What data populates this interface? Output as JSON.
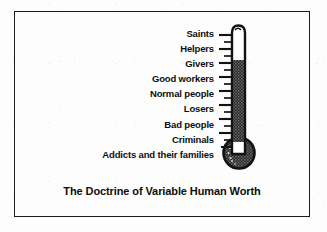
{
  "figure": {
    "caption": "The Doctrine of Variable Human Worth",
    "tiers": [
      "Saints",
      "Helpers",
      "Givers",
      "Good workers",
      "Normal people",
      "Losers",
      "Bad people",
      "Criminals",
      "Addicts and their families"
    ],
    "thermometer": {
      "fill_level_label": "Givers",
      "empty_tiers": [
        "Saints",
        "Helpers"
      ],
      "tick_count": 17,
      "ink_color": "#141414",
      "mercury_color": "#3a3a3a",
      "tube_color": "#ffffff"
    },
    "border_color": "#1c1c1c",
    "background_color": "#ffffff"
  }
}
